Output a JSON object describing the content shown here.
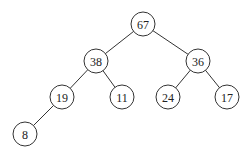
{
  "diagram": {
    "type": "binary-tree",
    "nodes": [
      {
        "id": "n0",
        "value": "67",
        "x": 143,
        "y": 24
      },
      {
        "id": "n1",
        "value": "38",
        "x": 96,
        "y": 61
      },
      {
        "id": "n2",
        "value": "36",
        "x": 198,
        "y": 61
      },
      {
        "id": "n3",
        "value": "19",
        "x": 62,
        "y": 97
      },
      {
        "id": "n4",
        "value": "11",
        "x": 122,
        "y": 97
      },
      {
        "id": "n5",
        "value": "24",
        "x": 168,
        "y": 97
      },
      {
        "id": "n6",
        "value": "17",
        "x": 227,
        "y": 97
      },
      {
        "id": "n7",
        "value": "8",
        "x": 25,
        "y": 134
      }
    ],
    "edges": [
      [
        "n0",
        "n1"
      ],
      [
        "n0",
        "n2"
      ],
      [
        "n1",
        "n3"
      ],
      [
        "n1",
        "n4"
      ],
      [
        "n2",
        "n5"
      ],
      [
        "n2",
        "n6"
      ],
      [
        "n3",
        "n7"
      ]
    ],
    "node_radius": 12,
    "colors": {
      "stroke": "#333333",
      "fill": "#ffffff",
      "text": "#222222"
    }
  }
}
